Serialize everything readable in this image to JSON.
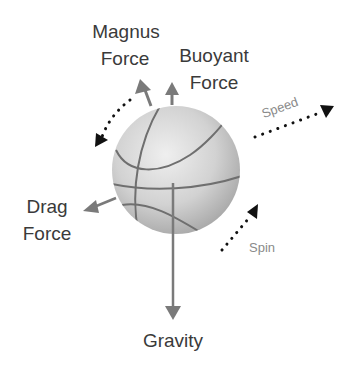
{
  "labels": {
    "magnus": [
      "Magnus",
      "Force"
    ],
    "buoyant": [
      "Buoyant",
      "Force"
    ],
    "drag": [
      "Drag",
      "Force"
    ],
    "gravity": "Gravity",
    "speed": "Speed",
    "spin": "Spin"
  },
  "colors": {
    "text": "#3a3a3a",
    "secondary_text": "#8a8a8a",
    "force_arrow": "#7a7a7a",
    "motion_arrow": "#111111",
    "ball_light": "#ececec",
    "ball_dark": "#a9a9a9",
    "seam": "#6f6f6f"
  },
  "elements": [
    {
      "name": "basketball",
      "type": "sphere"
    },
    {
      "name": "magnus-force-arrow",
      "direction": "up-left",
      "style": "solid"
    },
    {
      "name": "buoyant-force-arrow",
      "direction": "up",
      "style": "solid"
    },
    {
      "name": "drag-force-arrow",
      "direction": "left-down",
      "style": "solid"
    },
    {
      "name": "gravity-arrow",
      "direction": "down",
      "style": "solid"
    },
    {
      "name": "speed-arrow",
      "direction": "up-right",
      "style": "dotted"
    },
    {
      "name": "spin-arrow",
      "direction": "up-right",
      "style": "dotted"
    },
    {
      "name": "rotation-arrow",
      "direction": "counter-clockwise arc",
      "style": "dotted"
    }
  ]
}
